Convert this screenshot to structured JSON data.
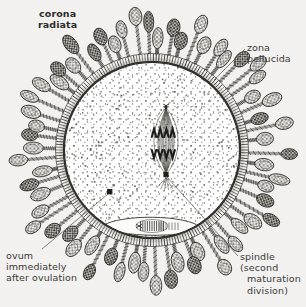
{
  "figure": {
    "kind": "biological-illustration",
    "background_color": "#f2f1ef",
    "ink_color": "#3a3a38"
  },
  "labels": {
    "corona_radiata": "corona\nradiata",
    "zona_pellucida": "zona\npellucida",
    "spindle_line1": "spindle",
    "spindle_line2": "(second",
    "spindle_line3": "maturation",
    "spindle_line4": "division)",
    "ovum": "ovum\nimmediately\nafter ovulation"
  },
  "structures": {
    "ovum": {
      "name": "ovum",
      "cx": 152,
      "cy": 150,
      "r": 88,
      "fill": "#ffffff"
    },
    "zona_pellucida": {
      "name": "zona-pellucida",
      "inner_r": 88,
      "outer_r": 96,
      "striations": 210
    },
    "corona_radiata": {
      "name": "corona-radiata",
      "cell_count": 62,
      "layers": 2
    },
    "spindle": {
      "name": "spindle-second-maturation-division",
      "cx": 166,
      "cy": 130,
      "chromosomes": 4
    },
    "polar_body_space": {
      "name": "perivitelline-space",
      "cx": 152,
      "cy": 228
    },
    "granule": {
      "name": "cytoplasmic-granule",
      "cx": 110,
      "cy": 192
    }
  }
}
